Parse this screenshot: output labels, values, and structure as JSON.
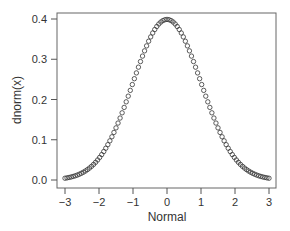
{
  "chart_data": {
    "type": "scatter",
    "title": "",
    "xlabel": "Normal",
    "ylabel": "dnorm(x)",
    "xlim": [
      -3,
      3
    ],
    "ylim": [
      0,
      0.4
    ],
    "x_ticks": [
      "-3",
      "-2",
      "-1",
      "0",
      "1",
      "2",
      "3"
    ],
    "y_ticks": [
      "0.0",
      "0.1",
      "0.2",
      "0.3",
      "0.4"
    ],
    "grid": false,
    "legend": null,
    "marker": "open-circle",
    "series": [
      {
        "name": "dnorm(x)",
        "function": "standard normal density",
        "x_start": -3,
        "x_end": 3,
        "n_points": 101,
        "sample_points": [
          {
            "x": -3,
            "y": 0.0044
          },
          {
            "x": -2,
            "y": 0.054
          },
          {
            "x": -1,
            "y": 0.242
          },
          {
            "x": 0,
            "y": 0.399
          },
          {
            "x": 1,
            "y": 0.242
          },
          {
            "x": 2,
            "y": 0.054
          },
          {
            "x": 3,
            "y": 0.0044
          }
        ]
      }
    ]
  },
  "colors": {
    "axis": "#555555",
    "marker_stroke": "#333333",
    "text": "#333333"
  }
}
